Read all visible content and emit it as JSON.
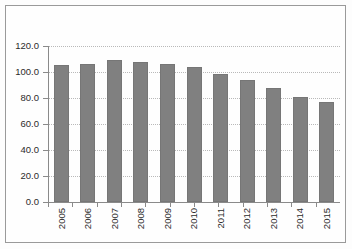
{
  "chart_data": {
    "type": "bar",
    "title": "",
    "subtitle": "",
    "xlabel": "",
    "ylabel": "",
    "categories": [
      "2005",
      "2006",
      "2007",
      "2008",
      "2009",
      "2010",
      "2011",
      "2012",
      "2013",
      "2014",
      "2015"
    ],
    "values": [
      105.5,
      106.5,
      109.0,
      107.5,
      106.5,
      103.5,
      98.5,
      94.0,
      88.0,
      80.5,
      77.0
    ],
    "ylim": [
      0.0,
      120.0
    ],
    "ytick_step": 20.0,
    "ytick_labels": [
      "120.0",
      "100.0",
      "80.0",
      "60.0",
      "40.0",
      "20.0",
      "0.0"
    ],
    "ytick_values": [
      120.0,
      100.0,
      80.0,
      60.0,
      40.0,
      20.0,
      0.0
    ],
    "grid": true,
    "grid_style": "dotted-horizontal",
    "legend": false,
    "legend_position": "none",
    "annotations": [],
    "colors": {
      "bar_fill": "#808080",
      "bar_border": "#767676",
      "gridline": "#b9b9b9",
      "axis": "#8a8a8a",
      "text": "#2b2b2b",
      "plot_background": "#fefefe",
      "frame_border": "#9a9a9a"
    }
  }
}
